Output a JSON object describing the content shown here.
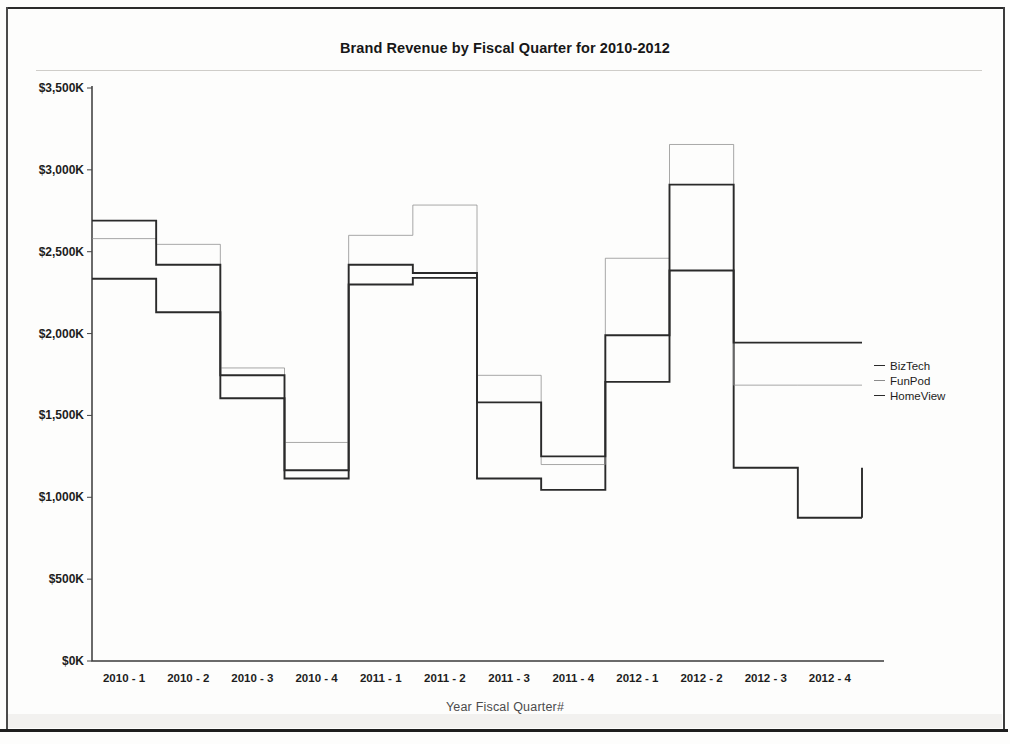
{
  "chart_data": {
    "type": "line",
    "title": "Brand Revenue by Fiscal Quarter for 2010-2012",
    "xlabel": "Year Fiscal Quarter#",
    "ylabel": "",
    "step": "post",
    "grid": false,
    "legend_position": "right",
    "ylim": [
      0,
      3500
    ],
    "ytick_labels": [
      "$0K",
      "$500K",
      "$1,000K",
      "$1,500K",
      "$2,000K",
      "$2,500K",
      "$3,000K",
      "$3,500K"
    ],
    "ytick_values": [
      0,
      500,
      1000,
      1500,
      2000,
      2500,
      3000,
      3500
    ],
    "categories": [
      "2010 - 1",
      "2010 - 2",
      "2010 - 3",
      "2010 - 4",
      "2011 - 1",
      "2011 - 2",
      "2011 - 3",
      "2011 - 4",
      "2012 - 1",
      "2012 - 2",
      "2012 - 3",
      "2012 - 4"
    ],
    "series": [
      {
        "name": "BizTech",
        "color": "#2a2a2a",
        "values": [
          2335,
          2130,
          1605,
          1115,
          2300,
          2340,
          1115,
          1045,
          1705,
          2385,
          1180,
          875
        ]
      },
      {
        "name": "FunPod",
        "color": "#8b8b8b",
        "values": [
          2580,
          2545,
          1790,
          1335,
          2600,
          2785,
          1745,
          1200,
          2460,
          3155,
          1685,
          1685
        ]
      },
      {
        "name": "HomeView",
        "color": "#2a2a2a",
        "values": [
          2690,
          2420,
          1745,
          1165,
          2420,
          2370,
          1580,
          1250,
          1990,
          2910,
          1945,
          1945
        ]
      }
    ]
  },
  "legend": {
    "items": [
      {
        "label": "BizTech"
      },
      {
        "label": "FunPod"
      },
      {
        "label": "HomeView"
      }
    ]
  }
}
